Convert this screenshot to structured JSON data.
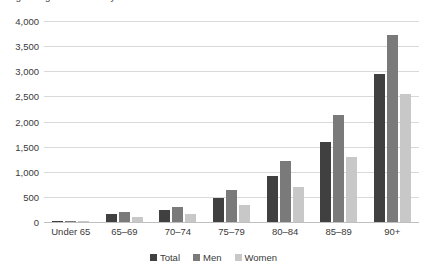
{
  "chart_data": {
    "type": "bar",
    "title": "Figure: Age distribution by sex",
    "xlabel": "",
    "ylabel": "",
    "ylim": [
      0,
      4000
    ],
    "ytick_step": 500,
    "ytick_labels": [
      "4,000",
      "3,500",
      "3,000",
      "2,500",
      "2,000",
      "1,500",
      "1,000",
      "500",
      "0"
    ],
    "ytick_values": [
      4000,
      3500,
      3000,
      2500,
      2000,
      1500,
      1000,
      500,
      0
    ],
    "grid": true,
    "legend_position": "bottom",
    "categories": [
      "Under 65",
      "65–69",
      "70–74",
      "75–79",
      "80–84",
      "85–89",
      "90+"
    ],
    "series": [
      {
        "name": "Total",
        "color": "#404040",
        "values": [
          20,
          150,
          230,
          480,
          920,
          1600,
          2950
        ]
      },
      {
        "name": "Men",
        "color": "#7a7a7a",
        "values": [
          20,
          200,
          300,
          630,
          1210,
          2120,
          3720
        ]
      },
      {
        "name": "Women",
        "color": "#c8c8c8",
        "values": [
          10,
          90,
          150,
          330,
          700,
          1290,
          2540
        ]
      }
    ]
  }
}
